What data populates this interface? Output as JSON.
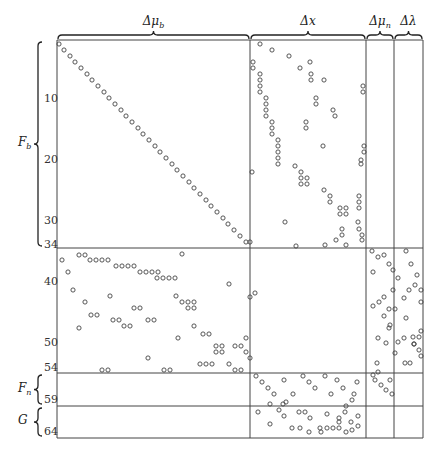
{
  "diagram": {
    "column_groups": [
      {
        "label": "Δμ_b",
        "display": "Δμ",
        "sub": "b",
        "x0": 57,
        "x1": 250
      },
      {
        "label": "Δx",
        "display": "Δx",
        "sub": "",
        "x0": 250,
        "x1": 366
      },
      {
        "label": "Δμ_n",
        "display": "Δμ",
        "sub": "n",
        "x0": 366,
        "x1": 394
      },
      {
        "label": "Δλ",
        "display": "Δλ",
        "sub": "",
        "x0": 394,
        "x1": 423
      }
    ],
    "row_groups": [
      {
        "label": "F_b",
        "display": "F",
        "sub": "b",
        "y0": 40,
        "y1": 248
      },
      {
        "label": "F_n",
        "display": "F",
        "sub": "n",
        "y0": 373,
        "y1": 406
      },
      {
        "label": "G",
        "display": "G",
        "sub": "",
        "y0": 406,
        "y1": 438
      }
    ],
    "row_ticks": [
      {
        "label": "10",
        "y": 99
      },
      {
        "label": "20",
        "y": 160
      },
      {
        "label": "30",
        "y": 221
      },
      {
        "label": "34",
        "y": 245
      },
      {
        "label": "40",
        "y": 282
      },
      {
        "label": "50",
        "y": 343
      },
      {
        "label": "54",
        "y": 368
      },
      {
        "label": "59",
        "y": 400
      },
      {
        "label": "64",
        "y": 432
      }
    ],
    "grid": {
      "x_lines": [
        57,
        250,
        366,
        394,
        423
      ],
      "y_lines": [
        40,
        248,
        373,
        406,
        438
      ]
    },
    "marker": "open-circle"
  },
  "chart_data": {
    "type": "scatter",
    "title": "",
    "xlabel": "",
    "ylabel": "",
    "note": "pixel coordinates [x, y] of nonzero entries (open circles)",
    "points": [
      [
        59,
        44
      ],
      [
        64,
        50
      ],
      [
        70,
        56
      ],
      [
        75,
        62
      ],
      [
        81,
        68
      ],
      [
        87,
        74
      ],
      [
        92,
        80
      ],
      [
        98,
        86
      ],
      [
        104,
        92
      ],
      [
        109,
        98
      ],
      [
        115,
        104
      ],
      [
        121,
        110
      ],
      [
        126,
        116
      ],
      [
        132,
        122
      ],
      [
        138,
        128
      ],
      [
        143,
        134
      ],
      [
        149,
        140
      ],
      [
        155,
        146
      ],
      [
        160,
        152
      ],
      [
        166,
        158
      ],
      [
        172,
        164
      ],
      [
        177,
        170
      ],
      [
        183,
        176
      ],
      [
        189,
        182
      ],
      [
        194,
        188
      ],
      [
        200,
        194
      ],
      [
        206,
        200
      ],
      [
        211,
        206
      ],
      [
        217,
        212
      ],
      [
        223,
        218
      ],
      [
        228,
        224
      ],
      [
        234,
        230
      ],
      [
        240,
        236
      ],
      [
        246,
        242
      ],
      [
        260,
        44
      ],
      [
        272,
        50
      ],
      [
        289,
        56
      ],
      [
        253,
        62
      ],
      [
        253,
        68
      ],
      [
        300,
        68
      ],
      [
        310,
        62
      ],
      [
        260,
        74
      ],
      [
        260,
        80
      ],
      [
        260,
        86
      ],
      [
        260,
        92
      ],
      [
        311,
        74
      ],
      [
        311,
        80
      ],
      [
        266,
        98
      ],
      [
        266,
        104
      ],
      [
        266,
        110
      ],
      [
        266,
        116
      ],
      [
        316,
        98
      ],
      [
        316,
        104
      ],
      [
        272,
        122
      ],
      [
        272,
        128
      ],
      [
        272,
        134
      ],
      [
        278,
        140
      ],
      [
        306,
        122
      ],
      [
        306,
        128
      ],
      [
        335,
        116
      ],
      [
        363,
        86
      ],
      [
        363,
        92
      ],
      [
        324,
        80
      ],
      [
        333,
        110
      ],
      [
        278,
        146
      ],
      [
        278,
        152
      ],
      [
        278,
        158
      ],
      [
        278,
        164
      ],
      [
        323,
        146
      ],
      [
        252,
        172
      ],
      [
        295,
        166
      ],
      [
        301,
        172
      ],
      [
        301,
        178
      ],
      [
        307,
        178
      ],
      [
        301,
        184
      ],
      [
        307,
        184
      ],
      [
        324,
        190
      ],
      [
        330,
        196
      ],
      [
        330,
        202
      ],
      [
        340,
        208
      ],
      [
        346,
        208
      ],
      [
        340,
        214
      ],
      [
        346,
        214
      ],
      [
        364,
        146
      ],
      [
        364,
        152
      ],
      [
        361,
        160
      ],
      [
        361,
        164
      ],
      [
        359,
        196
      ],
      [
        359,
        202
      ],
      [
        359,
        208
      ],
      [
        285,
        222
      ],
      [
        342,
        229
      ],
      [
        342,
        235
      ],
      [
        336,
        240
      ],
      [
        359,
        229
      ],
      [
        362,
        235
      ],
      [
        362,
        240
      ],
      [
        346,
        245
      ],
      [
        325,
        245
      ],
      [
        358,
        222
      ],
      [
        250,
        242
      ],
      [
        296,
        246
      ],
      [
        79,
        255
      ],
      [
        85,
        255
      ],
      [
        62,
        260
      ],
      [
        90,
        260
      ],
      [
        96,
        260
      ],
      [
        102,
        260
      ],
      [
        108,
        260
      ],
      [
        116,
        266
      ],
      [
        122,
        266
      ],
      [
        128,
        266
      ],
      [
        134,
        266
      ],
      [
        140,
        272
      ],
      [
        146,
        272
      ],
      [
        152,
        272
      ],
      [
        158,
        272
      ],
      [
        182,
        254
      ],
      [
        68,
        272
      ],
      [
        157,
        278
      ],
      [
        163,
        278
      ],
      [
        169,
        278
      ],
      [
        175,
        278
      ],
      [
        73,
        290
      ],
      [
        229,
        284
      ],
      [
        250,
        297
      ],
      [
        176,
        296
      ],
      [
        182,
        302
      ],
      [
        188,
        302
      ],
      [
        194,
        302
      ],
      [
        188,
        308
      ],
      [
        194,
        308
      ],
      [
        85,
        302
      ],
      [
        134,
        308
      ],
      [
        140,
        308
      ],
      [
        91,
        315
      ],
      [
        97,
        315
      ],
      [
        113,
        320
      ],
      [
        119,
        320
      ],
      [
        79,
        328
      ],
      [
        148,
        320
      ],
      [
        154,
        320
      ],
      [
        194,
        326
      ],
      [
        203,
        334
      ],
      [
        209,
        334
      ],
      [
        124,
        326
      ],
      [
        130,
        326
      ],
      [
        178,
        338
      ],
      [
        255,
        293
      ],
      [
        216,
        346
      ],
      [
        222,
        346
      ],
      [
        216,
        352
      ],
      [
        222,
        352
      ],
      [
        235,
        346
      ],
      [
        241,
        346
      ],
      [
        246,
        338
      ],
      [
        246,
        352
      ],
      [
        250,
        358
      ],
      [
        148,
        358
      ],
      [
        200,
        364
      ],
      [
        206,
        364
      ],
      [
        212,
        364
      ],
      [
        229,
        364
      ],
      [
        102,
        370
      ],
      [
        108,
        370
      ],
      [
        164,
        370
      ],
      [
        170,
        370
      ],
      [
        235,
        370
      ],
      [
        241,
        370
      ],
      [
        110,
        296
      ],
      [
        372,
        251
      ],
      [
        384,
        255
      ],
      [
        378,
        257
      ],
      [
        389,
        264
      ],
      [
        393,
        270
      ],
      [
        398,
        278
      ],
      [
        393,
        290
      ],
      [
        384,
        297
      ],
      [
        379,
        302
      ],
      [
        373,
        306
      ],
      [
        389,
        309
      ],
      [
        384,
        316
      ],
      [
        395,
        309
      ],
      [
        390,
        325
      ],
      [
        406,
        251
      ],
      [
        411,
        264
      ],
      [
        417,
        275
      ],
      [
        415,
        285
      ],
      [
        409,
        290
      ],
      [
        421,
        290
      ],
      [
        404,
        298
      ],
      [
        421,
        302
      ],
      [
        406,
        318
      ],
      [
        421,
        331
      ],
      [
        398,
        342
      ],
      [
        404,
        338
      ],
      [
        413,
        337
      ],
      [
        419,
        337
      ],
      [
        414,
        344
      ],
      [
        419,
        350
      ],
      [
        414,
        344
      ],
      [
        421,
        356
      ],
      [
        405,
        363
      ],
      [
        410,
        363
      ],
      [
        377,
        363
      ],
      [
        373,
        272
      ],
      [
        378,
        338
      ],
      [
        386,
        343
      ],
      [
        389,
        328
      ],
      [
        395,
        353
      ],
      [
        373,
        375
      ],
      [
        378,
        372
      ],
      [
        375,
        380
      ],
      [
        381,
        385
      ],
      [
        386,
        390
      ],
      [
        392,
        394
      ],
      [
        390,
        380
      ],
      [
        256,
        376
      ],
      [
        262,
        382
      ],
      [
        268,
        388
      ],
      [
        274,
        394
      ],
      [
        284,
        380
      ],
      [
        303,
        376
      ],
      [
        309,
        382
      ],
      [
        315,
        388
      ],
      [
        325,
        376
      ],
      [
        337,
        380
      ],
      [
        343,
        388
      ],
      [
        354,
        394
      ],
      [
        357,
        382
      ],
      [
        293,
        394
      ],
      [
        331,
        394
      ],
      [
        283,
        404
      ],
      [
        270,
        404
      ],
      [
        258,
        412
      ],
      [
        279,
        410
      ],
      [
        284,
        416
      ],
      [
        286,
        402
      ],
      [
        299,
        412
      ],
      [
        327,
        414
      ],
      [
        339,
        418
      ],
      [
        345,
        412
      ],
      [
        346,
        406
      ],
      [
        352,
        400
      ],
      [
        351,
        422
      ],
      [
        358,
        416
      ],
      [
        339,
        422
      ],
      [
        333,
        428
      ],
      [
        305,
        412
      ],
      [
        310,
        418
      ],
      [
        270,
        424
      ],
      [
        292,
        428
      ],
      [
        300,
        428
      ],
      [
        320,
        428
      ],
      [
        327,
        428
      ],
      [
        339,
        428
      ],
      [
        352,
        430
      ],
      [
        309,
        432
      ],
      [
        321,
        432
      ],
      [
        358,
        426
      ],
      [
        346,
        432
      ]
    ]
  }
}
